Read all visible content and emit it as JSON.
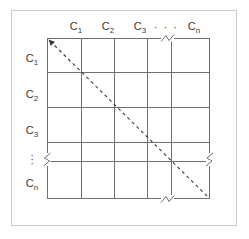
{
  "figure": {
    "type": "matrix-grid-diagram",
    "title": ""
  },
  "colors": {
    "outer_frame": "#c9c9c9",
    "grid_line": "#6f6f6f",
    "label_text": "#3b3b3b",
    "diagonal": "#3b3b3b",
    "background": "#ffffff"
  },
  "columns": {
    "header_labels": [
      {
        "base": "C",
        "sub": "1",
        "text": "C1"
      },
      {
        "base": "C",
        "sub": "2",
        "text": "C2"
      },
      {
        "base": "C",
        "sub": "3",
        "text": "C3"
      },
      {
        "base": "",
        "sub": "",
        "text": "· · ·"
      },
      {
        "base": "C",
        "sub": "n",
        "text": "Cn"
      }
    ],
    "ellipsis_symbol": "· · ·",
    "count_visible": 5
  },
  "rows": {
    "header_labels": [
      {
        "base": "C",
        "sub": "1",
        "text": "C1"
      },
      {
        "base": "C",
        "sub": "2",
        "text": "C2"
      },
      {
        "base": "C",
        "sub": "3",
        "text": "C3"
      },
      {
        "base": "",
        "sub": "",
        "text": "⋮"
      },
      {
        "base": "C",
        "sub": "n",
        "text": "Cn"
      }
    ],
    "ellipsis_symbol": "⋮",
    "count_visible": 5
  },
  "diagonal": {
    "style": "dashed",
    "from": "top-left",
    "to": "bottom-right",
    "arrowhead_at": "top-left",
    "label": ""
  },
  "break_marks": {
    "symbol": "zigzag-break",
    "locations": [
      "top-border",
      "left-border",
      "right-border",
      "bottom-border"
    ],
    "count": 4
  },
  "cells": {
    "values": [
      [
        "",
        "",
        "",
        "",
        ""
      ],
      [
        "",
        "",
        "",
        "",
        ""
      ],
      [
        "",
        "",
        "",
        "",
        ""
      ],
      [
        "",
        "",
        "",
        "",
        ""
      ],
      [
        "",
        "",
        "",
        "",
        ""
      ]
    ]
  }
}
